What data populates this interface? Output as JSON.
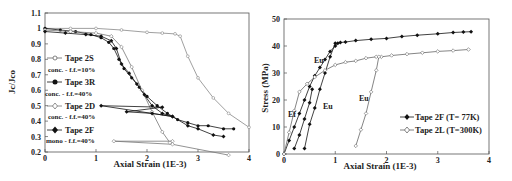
{
  "chart_data": [
    {
      "type": "line",
      "panel": "left",
      "title": "",
      "xlabel": "Axial Strain (1E-3)",
      "ylabel": "Jc/Jco",
      "xlim": [
        0,
        4
      ],
      "ylim": [
        0.2,
        1.1
      ],
      "xticks": [
        "0",
        "1",
        "2",
        "3",
        "4"
      ],
      "yticks": [
        "0.2",
        "0.3",
        "0.4",
        "0.5",
        "0.6",
        "0.7",
        "0.8",
        "0.9",
        "1",
        "1.1"
      ],
      "grid": false,
      "legend_position": "left-inside",
      "series": [
        {
          "name": "Tape 2S",
          "subtitle": "conc. - f.f.=10%",
          "marker": "open-circle",
          "color": "#888888",
          "x": [
            0,
            0.5,
            1.0,
            1.5,
            2.0,
            2.3,
            2.55,
            2.65,
            2.8,
            3.0,
            3.3,
            3.6,
            4.0
          ],
          "y": [
            1.0,
            1.0,
            1.0,
            0.99,
            0.975,
            0.97,
            0.965,
            0.95,
            0.82,
            0.68,
            0.55,
            0.45,
            0.36
          ]
        },
        {
          "name": "Tape 3R",
          "subtitle": "conc. - f.f.=40%",
          "marker": "filled-circle",
          "color": "#111111",
          "x": [
            0,
            0.3,
            0.6,
            0.9,
            1.1,
            1.25,
            1.35,
            1.45,
            1.55,
            1.7,
            1.85,
            2.0,
            2.2,
            2.4,
            2.6,
            2.8,
            3.0,
            3.2,
            3.5,
            3.7
          ],
          "y": [
            1.0,
            0.99,
            0.98,
            0.96,
            0.94,
            0.91,
            0.87,
            0.8,
            0.74,
            0.68,
            0.62,
            0.56,
            0.5,
            0.45,
            0.41,
            0.39,
            0.37,
            0.37,
            0.35,
            0.35
          ]
        },
        {
          "name": "Tape 2D",
          "subtitle": "conc. - f.f.=40%",
          "marker": "open-diamond",
          "color": "#777777",
          "x": [
            0,
            0.5,
            1.0,
            1.3,
            1.5,
            1.7,
            1.9,
            2.1,
            2.3,
            2.45,
            2.5,
            1.35,
            2.5,
            3.6
          ],
          "y": [
            0.99,
            0.98,
            0.97,
            0.95,
            0.88,
            0.75,
            0.6,
            0.46,
            0.33,
            0.26,
            0.27,
            0.27,
            0.25,
            0.18
          ]
        },
        {
          "name": "Tape 2F",
          "subtitle": "mono - f.f.=40%",
          "marker": "filled-diamond",
          "color": "#111111",
          "x": [
            0,
            0.4,
            0.8,
            1.1,
            1.3,
            1.4,
            1.5,
            1.65,
            1.8,
            1.95,
            2.1,
            2.3,
            2.5,
            1.1,
            2.3,
            1.6,
            2.1,
            2.5,
            2.8,
            3.0,
            3.3,
            3.5
          ],
          "y": [
            0.98,
            0.97,
            0.96,
            0.95,
            0.92,
            0.87,
            0.77,
            0.71,
            0.64,
            0.57,
            0.5,
            0.45,
            0.43,
            0.5,
            0.49,
            0.46,
            0.45,
            0.43,
            0.37,
            0.35,
            0.31,
            0.3
          ]
        }
      ]
    },
    {
      "type": "line",
      "panel": "right",
      "title": "",
      "xlabel": "Axial Strain (1E-3)",
      "ylabel": "Stress (MPa)",
      "xlim": [
        0,
        4
      ],
      "ylim": [
        0,
        50
      ],
      "xticks": [
        "0",
        "1",
        "2",
        "3",
        "4"
      ],
      "yticks": [
        "0",
        "10",
        "20",
        "30",
        "40",
        "50"
      ],
      "grid": false,
      "legend_position": "lower-right",
      "annotations": [
        "Ef",
        "Eu",
        "Eu",
        "Eu"
      ],
      "series": [
        {
          "name": "Tape 2F (T= 77K)",
          "marker": "filled-diamond",
          "color": "#111111",
          "x": [
            0,
            0.1,
            0.2,
            0.3,
            0.4,
            0.5,
            0.6,
            0.7,
            0.8,
            0.9,
            1.0,
            1.05,
            1.1,
            1.2,
            1.4,
            1.7,
            2.0,
            2.3,
            2.6,
            3.0,
            3.3,
            3.5,
            3.65
          ],
          "y": [
            0,
            5,
            10,
            15,
            20,
            25,
            29,
            32,
            35,
            38,
            40,
            41,
            41.3,
            41.5,
            42,
            42.5,
            42.8,
            43.5,
            44,
            44.5,
            45,
            45.2,
            45.3
          ]
        },
        {
          "name": "Tape 2F unload/reload 1",
          "marker": "filled-diamond",
          "color": "#111111",
          "x": [
            0.2,
            0.3,
            0.4,
            0.5,
            0.55
          ],
          "y": [
            2,
            7,
            13,
            19,
            24
          ]
        },
        {
          "name": "Tape 2F unload/reload 2",
          "marker": "filled-diamond",
          "color": "#111111",
          "x": [
            0.4,
            0.5,
            0.6,
            0.7,
            0.8,
            0.9,
            1.0
          ],
          "y": [
            2,
            11,
            17,
            24,
            30,
            36,
            41
          ]
        },
        {
          "name": "Tape 2L (T=300K)",
          "marker": "open-diamond",
          "color": "#666666",
          "x": [
            0,
            0.1,
            0.2,
            0.3,
            0.45,
            0.6,
            0.8,
            1.0,
            1.2,
            1.4,
            1.6,
            1.8,
            1.9,
            2.1,
            2.4,
            2.7,
            3.0,
            3.3,
            3.6
          ],
          "y": [
            0,
            8,
            16,
            23,
            26,
            28.5,
            31,
            33,
            34,
            34.5,
            35.5,
            36,
            36,
            36.5,
            37,
            37.5,
            38,
            38.3,
            38.7
          ]
        },
        {
          "name": "Tape 2L unload/reload",
          "marker": "open-diamond",
          "color": "#666666",
          "x": [
            1.4,
            1.5,
            1.6,
            1.7,
            1.8,
            1.85
          ],
          "y": [
            3,
            9,
            15,
            23,
            31,
            36
          ]
        }
      ]
    }
  ],
  "left_chart": {
    "ylabel": "Jc/Jco",
    "xlabel": "Axial Strain (1E-3)",
    "legend": [
      {
        "label": "Tape 2S",
        "sub": "conc. - f.f.=10%"
      },
      {
        "label": "Tape 3R",
        "sub": "conc. - f.f.=40%"
      },
      {
        "label": "Tape 2D",
        "sub": "conc. - f.f.=40%"
      },
      {
        "label": "Tape 2F",
        "sub": "mono - f.f.=40%"
      }
    ]
  },
  "right_chart": {
    "ylabel": "Stress (MPa)",
    "xlabel": "Axial Strain (1E-3)",
    "legend": [
      {
        "label": "Tape 2F (T= 77K)"
      },
      {
        "label": "Tape 2L (T=300K)"
      }
    ],
    "annotations": {
      "ef": "Ef",
      "eu1": "Eu",
      "eu2": "Eu",
      "eu3": "Eu"
    }
  }
}
